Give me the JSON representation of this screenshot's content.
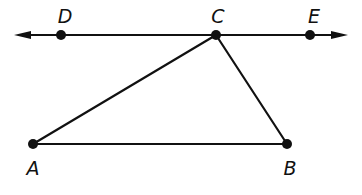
{
  "diagram": {
    "type": "geometry",
    "line": {
      "name": "line DE",
      "through": [
        "D",
        "C",
        "E"
      ],
      "arrows": "both-ends"
    },
    "points": [
      {
        "id": "D",
        "label": "D",
        "on": "line"
      },
      {
        "id": "C",
        "label": "C",
        "on": "line"
      },
      {
        "id": "E",
        "label": "E",
        "on": "line"
      },
      {
        "id": "A",
        "label": "A",
        "on": "triangle"
      },
      {
        "id": "B",
        "label": "B",
        "on": "triangle"
      }
    ],
    "segments": [
      {
        "from": "A",
        "to": "C"
      },
      {
        "from": "C",
        "to": "B"
      },
      {
        "from": "A",
        "to": "B"
      }
    ],
    "triangle": [
      "A",
      "B",
      "C"
    ],
    "colors": {
      "ink": "#111111",
      "background": "#ffffff"
    }
  }
}
